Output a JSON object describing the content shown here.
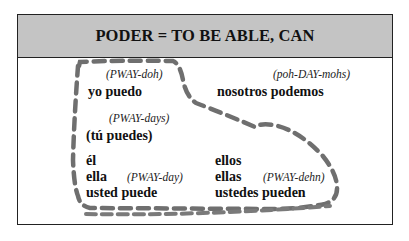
{
  "title": "PODER = TO BE ABLE, CAN",
  "conjugations": {
    "yo": {
      "pronunciation": "(PWAY-doh)",
      "form": "yo puedo"
    },
    "tu": {
      "pronunciation": "(PWAY-days)",
      "form": "(tú puedes)"
    },
    "nosotros": {
      "pronunciation": "(poh-DAY-mohs)",
      "form": "nosotros podemos"
    },
    "third_singular": {
      "pronouns": [
        "él",
        "ella",
        "usted puede"
      ],
      "pronunciation": "(PWAY-day)"
    },
    "third_plural": {
      "pronouns": [
        "ellos",
        "ellas",
        "ustedes pueden"
      ],
      "pronunciation": "(PWAY-dehn)"
    }
  },
  "colors": {
    "header_bg": "#c4c4c4",
    "boot_dash": "#6f6f6f",
    "border": "#222222"
  }
}
